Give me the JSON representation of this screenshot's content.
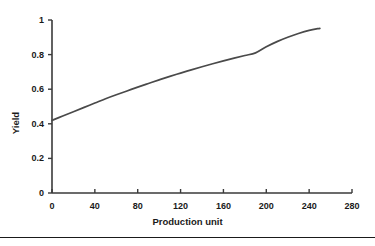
{
  "chart_data": {
    "type": "line",
    "title": "",
    "subtitle": "",
    "xlabel": "Production unit",
    "ylabel": "Yield",
    "xlim": [
      0,
      280
    ],
    "ylim": [
      0,
      1
    ],
    "grid": false,
    "legend": null,
    "legend_position": "none",
    "xticks": [
      "0",
      "40",
      "80",
      "120",
      "160",
      "200",
      "240",
      "280"
    ],
    "xtick_values": [
      0,
      40,
      80,
      120,
      160,
      200,
      240,
      280
    ],
    "yticks": [
      "0",
      "0.2",
      "0.4",
      "0.6",
      "0.8",
      "1"
    ],
    "ytick_values": [
      0,
      0.2,
      0.4,
      0.6,
      0.8,
      1
    ],
    "line_color": "#4a4a4a",
    "axis_color": "#3a3a3a",
    "series": [
      {
        "name": "Yield response",
        "x": [
          0,
          10,
          20,
          30,
          40,
          50,
          60,
          70,
          80,
          90,
          100,
          110,
          120,
          130,
          140,
          150,
          160,
          170,
          180,
          190,
          200,
          210,
          220,
          230,
          240,
          250
        ],
        "values": [
          0.42,
          0.445,
          0.47,
          0.495,
          0.52,
          0.545,
          0.568,
          0.59,
          0.612,
          0.633,
          0.654,
          0.674,
          0.693,
          0.712,
          0.73,
          0.747,
          0.764,
          0.78,
          0.795,
          0.81,
          0.845,
          0.875,
          0.9,
          0.922,
          0.94,
          0.952
        ]
      }
    ],
    "annotations": []
  },
  "axis": {
    "y_title": "Yield",
    "x_title": "Production unit"
  },
  "footer": {
    "rule": ""
  }
}
